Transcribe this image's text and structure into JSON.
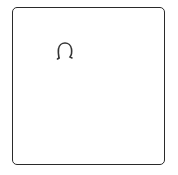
{
  "card": {
    "icon": "headphones-icon",
    "border_color": "#2a2a2a",
    "background": "#ffffff"
  }
}
